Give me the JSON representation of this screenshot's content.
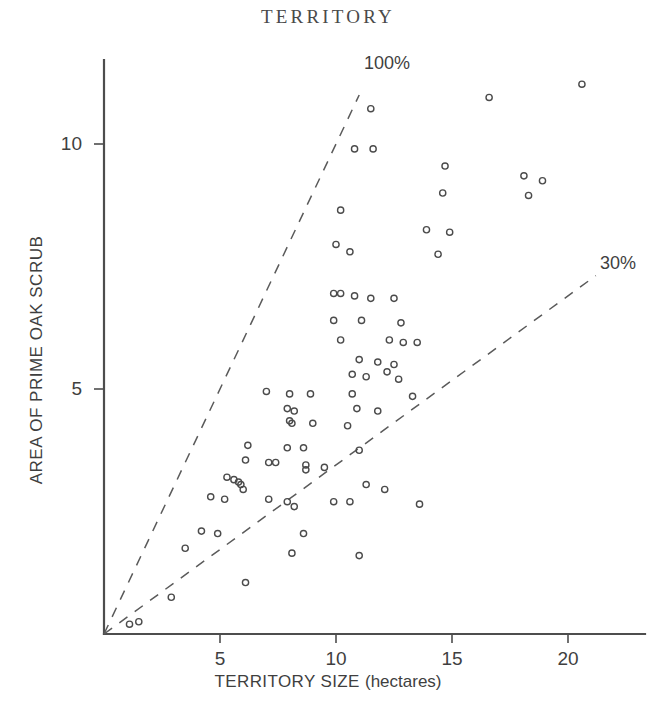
{
  "chart": {
    "title": "TERRITORY",
    "xlabel_main": "TERRITORY SIZE",
    "xlabel_unit": "(hectares)",
    "ylabel": "AREA OF PRIME OAK SCRUB",
    "ref_label_100": "100%",
    "ref_label_30": "30%",
    "x_ticks": [
      "5",
      "10",
      "15",
      "20"
    ],
    "y_ticks": [
      "5",
      "10"
    ],
    "marker_color": "#4b4b4b",
    "axis_color": "#4d4d4d"
  },
  "chart_data": {
    "type": "scatter",
    "title": "TERRITORY",
    "xlabel": "TERRITORY SIZE (hectares)",
    "ylabel": "AREA OF PRIME OAK SCRUB",
    "xlim": [
      0,
      21.8
    ],
    "ylim": [
      0,
      11.9
    ],
    "xticks": [
      5,
      10,
      15,
      20
    ],
    "yticks": [
      5,
      10
    ],
    "grid": false,
    "legend": "none",
    "marker": "open-circle",
    "annotations": [
      {
        "text": "100%",
        "x": 11.3,
        "y": 11.75
      },
      {
        "text": "30%",
        "x": 21.4,
        "y": 7.6
      }
    ],
    "reference_lines": [
      {
        "label": "100%",
        "slope": 1.0,
        "intercept": 0,
        "style": "dashed",
        "x_start": 0,
        "x_end": 11.0
      },
      {
        "label": "30%",
        "slope": 0.345,
        "intercept": 0,
        "style": "dashed",
        "x_start": 0,
        "x_end": 21.2
      }
    ],
    "points": [
      [
        20.6,
        11.22
      ],
      [
        16.6,
        10.95
      ],
      [
        11.5,
        10.72
      ],
      [
        10.8,
        9.9
      ],
      [
        11.6,
        9.9
      ],
      [
        14.7,
        9.55
      ],
      [
        18.1,
        9.35
      ],
      [
        18.9,
        9.25
      ],
      [
        14.6,
        9.0
      ],
      [
        18.3,
        8.95
      ],
      [
        10.2,
        8.65
      ],
      [
        13.9,
        8.25
      ],
      [
        14.9,
        8.2
      ],
      [
        10.0,
        7.95
      ],
      [
        10.6,
        7.8
      ],
      [
        14.4,
        7.75
      ],
      [
        9.9,
        6.95
      ],
      [
        10.2,
        6.95
      ],
      [
        10.8,
        6.9
      ],
      [
        11.5,
        6.85
      ],
      [
        12.5,
        6.85
      ],
      [
        9.9,
        6.4
      ],
      [
        11.1,
        6.4
      ],
      [
        12.8,
        6.35
      ],
      [
        10.2,
        6.0
      ],
      [
        12.3,
        6.0
      ],
      [
        12.9,
        5.95
      ],
      [
        13.5,
        5.95
      ],
      [
        11.0,
        5.6
      ],
      [
        11.8,
        5.55
      ],
      [
        12.5,
        5.5
      ],
      [
        12.2,
        5.35
      ],
      [
        10.7,
        5.3
      ],
      [
        11.3,
        5.25
      ],
      [
        12.7,
        5.2
      ],
      [
        7.0,
        4.95
      ],
      [
        8.0,
        4.9
      ],
      [
        8.9,
        4.9
      ],
      [
        10.7,
        4.9
      ],
      [
        13.3,
        4.85
      ],
      [
        7.9,
        4.6
      ],
      [
        8.2,
        4.55
      ],
      [
        10.9,
        4.6
      ],
      [
        11.8,
        4.55
      ],
      [
        8.0,
        4.35
      ],
      [
        8.1,
        4.3
      ],
      [
        9.0,
        4.3
      ],
      [
        10.5,
        4.25
      ],
      [
        6.2,
        3.85
      ],
      [
        7.9,
        3.8
      ],
      [
        8.6,
        3.8
      ],
      [
        11.0,
        3.75
      ],
      [
        6.1,
        3.55
      ],
      [
        7.1,
        3.5
      ],
      [
        7.4,
        3.5
      ],
      [
        8.7,
        3.45
      ],
      [
        8.7,
        3.35
      ],
      [
        9.5,
        3.4
      ],
      [
        5.3,
        3.2
      ],
      [
        5.6,
        3.15
      ],
      [
        5.8,
        3.1
      ],
      [
        5.9,
        3.05
      ],
      [
        6.0,
        2.95
      ],
      [
        11.3,
        3.05
      ],
      [
        12.1,
        2.95
      ],
      [
        4.6,
        2.8
      ],
      [
        5.2,
        2.75
      ],
      [
        7.1,
        2.75
      ],
      [
        7.9,
        2.7
      ],
      [
        8.2,
        2.6
      ],
      [
        9.9,
        2.7
      ],
      [
        10.6,
        2.7
      ],
      [
        13.6,
        2.65
      ],
      [
        4.2,
        2.1
      ],
      [
        4.9,
        2.05
      ],
      [
        8.6,
        2.05
      ],
      [
        3.5,
        1.75
      ],
      [
        8.1,
        1.65
      ],
      [
        11.0,
        1.6
      ],
      [
        6.1,
        1.05
      ],
      [
        2.9,
        0.75
      ],
      [
        1.5,
        0.25
      ],
      [
        1.1,
        0.2
      ]
    ]
  }
}
